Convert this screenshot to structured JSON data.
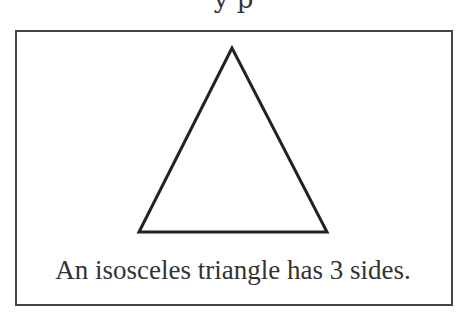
{
  "top_partial_text": "y     p",
  "figure": {
    "shape": "isosceles-triangle",
    "vertices": {
      "apex": [
        232,
        48
      ],
      "bottom_left": [
        139,
        232
      ],
      "bottom_right": [
        327,
        232
      ]
    },
    "stroke_color": "#222222"
  },
  "caption": "An isosceles triangle has 3 sides."
}
